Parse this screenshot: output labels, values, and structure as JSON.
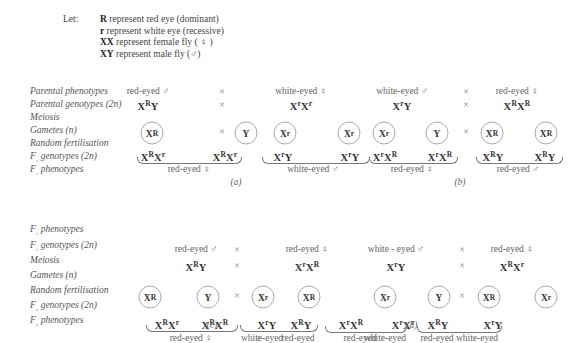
{
  "legend": {
    "let": "Let:",
    "lines": [
      {
        "sym": "R",
        "text": " represent red eye (dominant)"
      },
      {
        "sym": "r",
        "text": " represent white eye (recessive)"
      },
      {
        "sym": "XX",
        "text": " represent female fly ( ♀ )"
      },
      {
        "sym": "XY",
        "text": " represent male fly (♂)"
      }
    ]
  },
  "top_labels": [
    "Parental phenotypes",
    "Parental genotypes (2n)",
    "Meiosis",
    "Gametes (n)",
    "Random fertilisation",
    "F₁ genotypes (2n)",
    "F₁ phenotypes"
  ],
  "bottom_labels": [
    "F₁ phenotypes",
    "F₁ genotypes (2n)",
    "Meiosis",
    "Gametes (n)",
    "Random fertilisation",
    "F₂ genotypes (2n)",
    "F₂ phenotypes"
  ],
  "cross_symbol": "×",
  "panels": {
    "a": {
      "caption": "(a)",
      "male_phenotype": "red-eyed ♂",
      "female_phenotype": "white-eyed ♀",
      "male_genotype": {
        "b": "X",
        "s": "R",
        "t": "Y"
      },
      "female_genotype": {
        "b": "X",
        "s": "r",
        "c": "X",
        "s2": "r"
      },
      "gametes": [
        {
          "b": "X",
          "s": "R"
        },
        {
          "b": "Y",
          "s": ""
        },
        {
          "b": "X",
          "s": "r"
        },
        {
          "b": "X",
          "s": "r"
        }
      ],
      "offspring": [
        {
          "b": "X",
          "s": "R",
          "c": "X",
          "s2": "r"
        },
        {
          "b": "X",
          "s": "R",
          "c": "X",
          "s2": "r"
        },
        {
          "b": "X",
          "s": "r",
          "c": "Y",
          "s2": ""
        },
        {
          "b": "X",
          "s": "r",
          "c": "Y",
          "s2": ""
        }
      ],
      "group1": "red-eyed ♀",
      "group2": "white-eyed ♂"
    },
    "b": {
      "caption": "(b)",
      "male_phenotype": "white-eyed ♂",
      "female_phenotype": "red-eyed ♀",
      "male_genotype": {
        "b": "X",
        "s": "r",
        "t": "Y"
      },
      "female_genotype": {
        "b": "X",
        "s": "R",
        "c": "X",
        "s2": "R"
      },
      "gametes": [
        {
          "b": "X",
          "s": "r"
        },
        {
          "b": "Y",
          "s": ""
        },
        {
          "b": "X",
          "s": "R"
        },
        {
          "b": "X",
          "s": "R"
        }
      ],
      "offspring": [
        {
          "b": "X",
          "s": "r",
          "c": "X",
          "s2": "R"
        },
        {
          "b": "X",
          "s": "r",
          "c": "X",
          "s2": "R"
        },
        {
          "b": "X",
          "s": "R",
          "c": "Y",
          "s2": ""
        },
        {
          "b": "X",
          "s": "R",
          "c": "Y",
          "s2": ""
        }
      ],
      "group1": "red-eyed ♀",
      "group2": "red-eyed ♂"
    },
    "c": {
      "caption": "(c)",
      "male_phenotype": "red-eyed ♂",
      "female_phenotype": "red-eyed ♀",
      "male_genotype": {
        "b": "X",
        "s": "R",
        "t": "Y"
      },
      "female_genotype": {
        "b": "X",
        "s": "r",
        "c": "X",
        "s2": "R"
      },
      "gametes": [
        {
          "b": "X",
          "s": "R"
        },
        {
          "b": "Y",
          "s": ""
        },
        {
          "b": "X",
          "s": "r"
        },
        {
          "b": "X",
          "s": "R"
        }
      ],
      "offspring": [
        {
          "b": "X",
          "s": "R",
          "c": "X",
          "s2": "r"
        },
        {
          "b": "X",
          "s": "R",
          "c": "X",
          "s2": "R"
        },
        {
          "b": "X",
          "s": "r",
          "c": "Y",
          "s2": ""
        },
        {
          "b": "X",
          "s": "R",
          "c": "Y",
          "s2": ""
        }
      ],
      "group1": "red-eyed ♀",
      "pheno3": "white-eyed",
      "pheno4": "red-eyed",
      "group2_sex": "♂"
    },
    "d": {
      "caption": "(d)",
      "male_phenotype": "white - eyed ♂",
      "female_phenotype": "red-eyed ♀",
      "male_genotype": {
        "b": "X",
        "s": "r",
        "t": "Y"
      },
      "female_genotype": {
        "b": "X",
        "s": "R",
        "c": "X",
        "s2": "r"
      },
      "gametes": [
        {
          "b": "X",
          "s": "r"
        },
        {
          "b": "Y",
          "s": ""
        },
        {
          "b": "X",
          "s": "R"
        },
        {
          "b": "X",
          "s": "r"
        }
      ],
      "offspring": [
        {
          "b": "X",
          "s": "r",
          "c": "X",
          "s2": "R"
        },
        {
          "b": "X",
          "s": "r",
          "c": "X",
          "s2": "r"
        },
        {
          "b": "X",
          "s": "R",
          "c": "Y",
          "s2": ""
        },
        {
          "b": "X",
          "s": "r",
          "c": "Y",
          "s2": ""
        }
      ],
      "pheno1": "red-eyed",
      "pheno2": "white-eyed",
      "pheno3": "red-eyed",
      "pheno4": "white-eyed",
      "group1_sex": "♀",
      "group2_sex": "♂"
    }
  }
}
